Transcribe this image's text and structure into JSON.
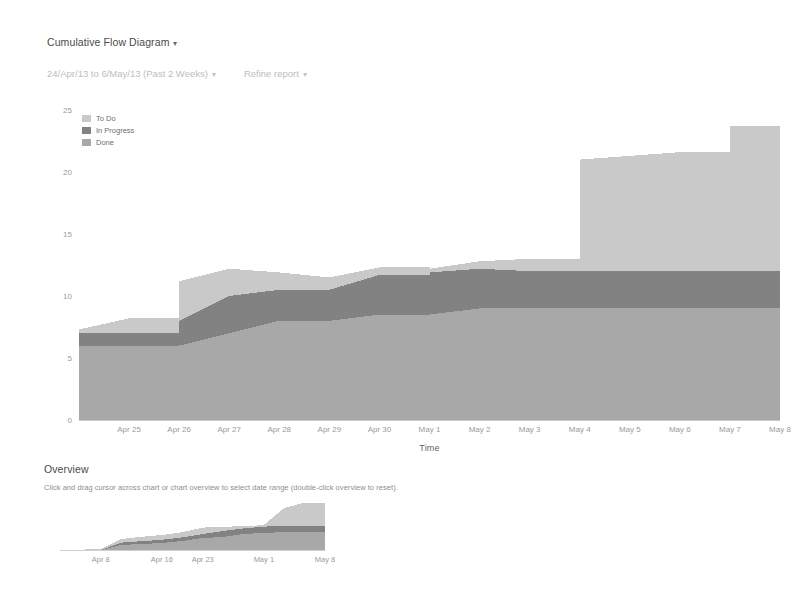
{
  "header": {
    "report_title": "Cumulative Flow Diagram",
    "report_title_caret": "▾",
    "date_range": "24/Apr/13 to 6/May/13 (Past 2 Weeks)",
    "date_range_caret": "▾",
    "refine_label": "Refine report",
    "refine_caret": "▾"
  },
  "legend": {
    "position": "top-left-inside",
    "items": [
      {
        "label": "To Do",
        "color": "#c9c9c9"
      },
      {
        "label": "In Progress",
        "color": "#828282"
      },
      {
        "label": "Done",
        "color": "#a8a8a8"
      }
    ]
  },
  "overview": {
    "heading": "Overview",
    "hint": "Click and drag cursor across chart or chart overview to select date range (double-click overview to reset)."
  },
  "chart_data": {
    "type": "area",
    "stacked": true,
    "title": "Cumulative Flow Diagram",
    "xlabel": "Time",
    "ylabel": "Number of Issues",
    "ylim": [
      0,
      25
    ],
    "yticks": [
      0,
      5,
      10,
      15,
      20,
      25
    ],
    "grid": false,
    "x": [
      "Apr 24",
      "Apr 25",
      "Apr 26",
      "Apr 27",
      "Apr 28",
      "Apr 29",
      "Apr 30",
      "May 1",
      "May 2",
      "May 3",
      "May 4",
      "May 5",
      "May 6",
      "May 7",
      "May 8"
    ],
    "xticks": [
      "Apr 25",
      "Apr 26",
      "Apr 27",
      "Apr 28",
      "Apr 29",
      "Apr 30",
      "May 1",
      "May 2",
      "May 3",
      "May 4",
      "May 5",
      "May 6",
      "May 7",
      "May 8"
    ],
    "series": [
      {
        "name": "Done",
        "color": "#a8a8a8",
        "values": [
          6,
          6,
          6,
          7,
          8,
          8,
          8.5,
          8.5,
          9,
          9,
          9,
          9,
          9,
          9,
          9
        ]
      },
      {
        "name": "In Progress",
        "color": "#828282",
        "values": [
          1,
          1,
          2,
          3,
          2.5,
          2.5,
          3.2,
          3.4,
          3.2,
          3,
          3,
          3,
          3,
          3,
          3
        ]
      },
      {
        "name": "To Do",
        "color": "#c9c9c9",
        "values": [
          0.3,
          1.2,
          3.2,
          2.2,
          1.4,
          1,
          0.6,
          0.3,
          0.6,
          1,
          9,
          9.3,
          9.6,
          11.7,
          11.7
        ]
      }
    ],
    "totals": [
      7.3,
      8.2,
      11.2,
      12.2,
      11.9,
      11.5,
      12.3,
      12.2,
      12.8,
      13,
      21,
      21.3,
      21.6,
      23.7,
      23.7
    ]
  },
  "overview_chart_data": {
    "type": "area",
    "stacked": true,
    "ylim": [
      0,
      25
    ],
    "xticks": [
      "Apr 8",
      "Apr 16",
      "Apr 23",
      "May 1",
      "May 8"
    ],
    "x": [
      "Apr 2",
      "Apr 5",
      "Apr 8",
      "Apr 11",
      "Apr 14",
      "Apr 16",
      "Apr 19",
      "Apr 23",
      "Apr 26",
      "Apr 29",
      "May 1",
      "May 4",
      "May 6",
      "May 8"
    ],
    "series": [
      {
        "name": "Done",
        "color": "#a8a8a8",
        "values": [
          0,
          0,
          0,
          2.5,
          3,
          3.5,
          4.5,
          6,
          6.5,
          8,
          8.5,
          9,
          9,
          9
        ]
      },
      {
        "name": "In Progress",
        "color": "#828282",
        "values": [
          0,
          0,
          0,
          1.2,
          1.4,
          1.6,
          1.8,
          2,
          3,
          2.8,
          3.2,
          3,
          3,
          3
        ]
      },
      {
        "name": "To Do",
        "color": "#c9c9c9",
        "values": [
          0,
          0.2,
          0.4,
          1.8,
          2.2,
          2.4,
          2.6,
          3.2,
          2.2,
          1,
          0.8,
          9,
          11.7,
          11.7
        ]
      }
    ]
  },
  "colors": {
    "axis": "#c8c8c8",
    "tick_text": "#9a9a9a",
    "axis_title": "#6e6e6e",
    "muted_text": "#bdbdbd",
    "title_text": "#4a4a4a"
  }
}
